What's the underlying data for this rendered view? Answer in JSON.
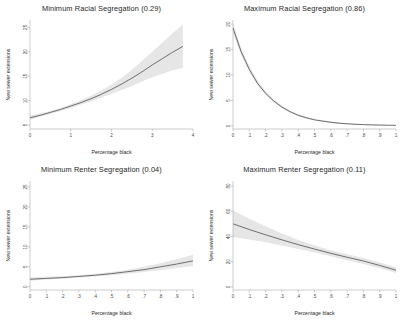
{
  "figure": {
    "background": "#ffffff",
    "line_color": "#58585a",
    "band_color": "#e6e6e6",
    "axis_color": "#9a9a9a"
  },
  "chart_data": [
    {
      "type": "line",
      "panel_index": 0,
      "title": "Minimum Racial Segregation (0.29)",
      "xlabel": "Percentage black",
      "ylabel": "New sewer extensions",
      "xlim": [
        0,
        4
      ],
      "ylim": [
        4.2,
        26.5
      ],
      "grid": false,
      "legend": "none",
      "xticks": [
        0,
        1,
        2,
        3,
        4
      ],
      "xticklabels": [
        "0",
        "1",
        "2",
        "3",
        "4"
      ],
      "yticks": [
        5,
        10,
        15,
        20,
        25
      ],
      "yticklabels": [
        "5",
        "10",
        "15",
        "20",
        "25"
      ],
      "x": [
        0,
        0.25,
        0.5,
        0.75,
        1.0,
        1.25,
        1.5,
        1.75,
        2.0,
        2.25,
        2.5,
        2.75,
        3.0,
        3.25,
        3.5,
        3.75
      ],
      "series": [
        {
          "name": "Predicted new sewer extensions",
          "values": [
            6.5,
            7.0,
            7.6,
            8.2,
            8.9,
            9.6,
            10.4,
            11.3,
            12.3,
            13.4,
            14.6,
            15.9,
            17.3,
            18.6,
            19.9,
            21.1
          ],
          "ci_lower": [
            6.1,
            6.7,
            7.3,
            7.9,
            8.5,
            9.2,
            9.9,
            10.6,
            11.4,
            12.2,
            13.0,
            13.9,
            14.8,
            15.5,
            16.2,
            16.7
          ],
          "ci_upper": [
            6.9,
            7.4,
            7.9,
            8.5,
            9.3,
            10.1,
            11.0,
            12.1,
            13.3,
            14.7,
            16.3,
            18.1,
            20.0,
            21.9,
            23.8,
            25.6
          ]
        }
      ]
    },
    {
      "type": "line",
      "panel_index": 1,
      "title": "Maximum Racial Segregation (0.86)",
      "xlabel": "Percentage black",
      "ylabel": "New sewer extensions",
      "xlim": [
        0,
        1
      ],
      "ylim": [
        -0.6,
        20.8
      ],
      "grid": false,
      "legend": "none",
      "xticks": [
        0,
        0.1,
        0.2,
        0.3,
        0.4,
        0.5,
        0.6,
        0.7,
        0.8,
        0.9,
        1
      ],
      "xticklabels": [
        "0",
        ".1",
        ".2",
        ".3",
        ".4",
        ".5",
        ".6",
        ".7",
        ".8",
        ".9",
        "1"
      ],
      "yticks": [
        0,
        5,
        10,
        15,
        20
      ],
      "yticklabels": [
        "0",
        "5",
        "10",
        "15",
        "20"
      ],
      "x": [
        0,
        0.05,
        0.1,
        0.15,
        0.2,
        0.25,
        0.3,
        0.35,
        0.4,
        0.45,
        0.5,
        0.55,
        0.6,
        0.65,
        0.7,
        0.75,
        0.8,
        0.85,
        0.9,
        0.95,
        1.0
      ],
      "series": [
        {
          "name": "Predicted new sewer extensions",
          "values": [
            19.2,
            14.6,
            11.1,
            8.4,
            6.4,
            4.9,
            3.7,
            2.8,
            2.1,
            1.6,
            1.2,
            0.95,
            0.72,
            0.55,
            0.42,
            0.33,
            0.26,
            0.21,
            0.17,
            0.14,
            0.12
          ],
          "ci_lower": [
            18.2,
            13.9,
            10.6,
            8.0,
            6.1,
            4.6,
            3.5,
            2.6,
            1.9,
            1.4,
            1.05,
            0.8,
            0.6,
            0.45,
            0.33,
            0.25,
            0.19,
            0.15,
            0.11,
            0.09,
            0.07
          ],
          "ci_upper": [
            20.2,
            15.3,
            11.7,
            8.9,
            6.8,
            5.2,
            4.0,
            3.05,
            2.32,
            1.78,
            1.38,
            1.1,
            0.86,
            0.67,
            0.53,
            0.43,
            0.35,
            0.29,
            0.24,
            0.2,
            0.18
          ]
        }
      ]
    },
    {
      "type": "line",
      "panel_index": 2,
      "title": "Minimum Renter Segregation (0.04)",
      "xlabel": "Percentage black",
      "ylabel": "New sewer extensions",
      "xlim": [
        0,
        1
      ],
      "ylim": [
        -0.8,
        26.5
      ],
      "grid": false,
      "legend": "none",
      "xticks": [
        0,
        0.1,
        0.2,
        0.3,
        0.4,
        0.5,
        0.6,
        0.7,
        0.8,
        0.9,
        1
      ],
      "xticklabels": [
        "0",
        ".1",
        ".2",
        ".3",
        ".4",
        ".5",
        ".6",
        ".7",
        ".8",
        ".9",
        "1"
      ],
      "yticks": [
        0,
        5,
        10,
        15,
        20,
        25
      ],
      "yticklabels": [
        "0",
        "5",
        "10",
        "15",
        "20",
        "25"
      ],
      "x": [
        0,
        0.1,
        0.2,
        0.3,
        0.4,
        0.5,
        0.6,
        0.7,
        0.8,
        0.9,
        1.0
      ],
      "series": [
        {
          "name": "Predicted new sewer extensions",
          "values": [
            1.9,
            2.1,
            2.3,
            2.6,
            2.9,
            3.3,
            3.8,
            4.3,
            5.0,
            5.7,
            6.5
          ],
          "ci_lower": [
            1.5,
            1.8,
            2.0,
            2.3,
            2.6,
            2.9,
            3.3,
            3.7,
            4.2,
            4.7,
            5.2
          ],
          "ci_upper": [
            2.3,
            2.5,
            2.7,
            2.9,
            3.3,
            3.7,
            4.3,
            5.0,
            5.9,
            6.9,
            8.0
          ]
        }
      ]
    },
    {
      "type": "line",
      "panel_index": 3,
      "title": "Maximum Renter Segregation (0.11)",
      "xlabel": "Percentage black",
      "ylabel": "New sewer extensions",
      "xlim": [
        0,
        1
      ],
      "ylim": [
        -2.5,
        84
      ],
      "grid": false,
      "legend": "none",
      "xticks": [
        0,
        0.1,
        0.2,
        0.3,
        0.4,
        0.5,
        0.6,
        0.7,
        0.8,
        0.9,
        1
      ],
      "xticklabels": [
        "0",
        ".1",
        ".2",
        ".3",
        ".4",
        ".5",
        ".6",
        ".7",
        ".8",
        ".9",
        "1"
      ],
      "yticks": [
        0,
        20,
        40,
        60,
        80
      ],
      "yticklabels": [
        "0",
        "20",
        "40",
        "60",
        "80"
      ],
      "x": [
        0,
        0.1,
        0.2,
        0.3,
        0.4,
        0.5,
        0.6,
        0.7,
        0.8,
        0.9,
        1.0
      ],
      "series": [
        {
          "name": "Predicted new sewer extensions",
          "values": [
            50.0,
            45.5,
            41.3,
            37.3,
            33.5,
            30.0,
            26.6,
            23.5,
            20.5,
            17.0,
            13.2
          ],
          "ci_lower": [
            39.5,
            37.5,
            35.3,
            32.8,
            30.0,
            27.2,
            24.2,
            21.2,
            18.2,
            14.8,
            11.0
          ],
          "ci_upper": [
            60.5,
            54.0,
            48.0,
            42.3,
            37.2,
            32.9,
            29.1,
            25.8,
            22.8,
            19.3,
            15.5
          ]
        }
      ]
    }
  ]
}
